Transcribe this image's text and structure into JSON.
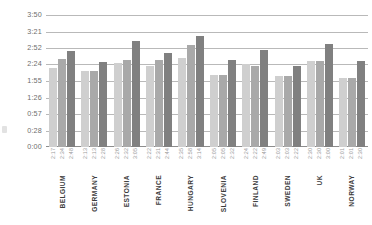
{
  "chart_data": {
    "type": "bar",
    "title": "",
    "subtitle": "",
    "xlabel": "",
    "ylabel": "",
    "grid": true,
    "legend": "none",
    "value_format": "h:mm",
    "ylim": [
      "0:00",
      "3:50"
    ],
    "yticks": [
      "0:00",
      "0:28",
      "0:57",
      "1:26",
      "1:55",
      "2:24",
      "2:52",
      "3:21",
      "3:50"
    ],
    "ytick_minutes": [
      0,
      28,
      57,
      86,
      115,
      144,
      172,
      201,
      230
    ],
    "categories": [
      "BELGIUM",
      "GERMANY",
      "ESTONIA",
      "FRANCE",
      "HUNGARY",
      "SLOVENIA",
      "FINLAND",
      "SWEDEN",
      "UK",
      "NORWAY"
    ],
    "series": [
      {
        "name": "series-1",
        "color": "#cfcfcf",
        "labels": [
          "2:17",
          "2:13",
          "2:26",
          "2:22",
          "2:35",
          "2:05",
          "2:24",
          "2:03",
          "2:30",
          "2:01"
        ],
        "values": [
          137,
          133,
          146,
          142,
          155,
          125,
          144,
          123,
          150,
          121
        ]
      },
      {
        "name": "series-2",
        "color": "#a9a9a9",
        "labels": [
          "2:34",
          "2:13",
          "2:32",
          "2:31",
          "2:58",
          "2:05",
          "2:22",
          "2:03",
          "2:30",
          "2:01"
        ],
        "values": [
          154,
          133,
          152,
          151,
          178,
          125,
          142,
          123,
          150,
          121
        ]
      },
      {
        "name": "series-3",
        "color": "#808080",
        "labels": [
          "2:48",
          "2:28",
          "3:05",
          "2:44",
          "3:14",
          "2:32",
          "2:49",
          "2:22",
          "3:00",
          "2:30"
        ],
        "values": [
          168,
          148,
          185,
          164,
          194,
          152,
          169,
          142,
          180,
          150
        ]
      }
    ]
  }
}
